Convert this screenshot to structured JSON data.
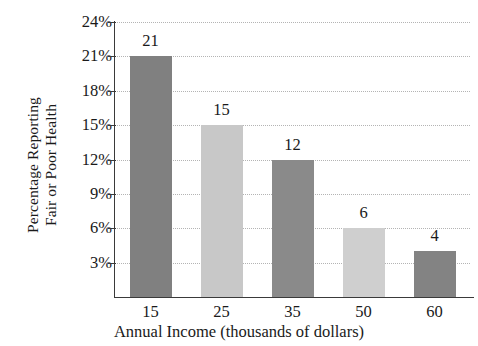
{
  "chart_data": {
    "type": "bar",
    "title": "",
    "subtitle": "",
    "categories": [
      "15",
      "25",
      "35",
      "50",
      "60"
    ],
    "values": [
      21,
      15,
      12,
      6,
      4
    ],
    "value_labels": [
      "21",
      "15",
      "12",
      "6",
      "4"
    ],
    "xlabel": "Annual Income (thousands of dollars)",
    "ylabel": "Percentage Reporting Fair or Poor Health",
    "ylabel_lines": [
      "Percentage Reporting",
      "Fair or Poor Health"
    ],
    "ylim": [
      0,
      24
    ],
    "ytick_values": [
      3,
      6,
      9,
      12,
      15,
      18,
      21,
      24
    ],
    "ytick_labels": [
      "3%",
      "6%",
      "9%",
      "12%",
      "15%",
      "18%",
      "21%",
      "24%"
    ],
    "grid": true,
    "grid_style": "dotted-horizontal",
    "legend": "none",
    "bar_colors": [
      "#808080",
      "#c8c8c8",
      "#8a8a8a",
      "#cfcfcf",
      "#838383"
    ],
    "axis_color": "#3a3a3a",
    "grid_color": "#b4b4b4",
    "background_color": "#ffffff"
  }
}
